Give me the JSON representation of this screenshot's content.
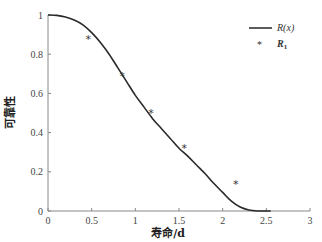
{
  "chart_data": {
    "type": "line",
    "title": "",
    "xlabel": "寿命/d",
    "ylabel": "可靠性",
    "xlim": [
      0,
      3
    ],
    "ylim": [
      0,
      1
    ],
    "x_ticks": [
      "0",
      "0.5",
      "1",
      "1.5",
      "2",
      "2.5",
      "3"
    ],
    "y_ticks": [
      "0",
      "0.2",
      "0.4",
      "0.6",
      "0.8",
      "1"
    ],
    "grid": false,
    "legend_position": "upper right",
    "series": [
      {
        "name": "R(x)",
        "style": "line",
        "x": [
          0,
          0.1,
          0.2,
          0.3,
          0.4,
          0.5,
          0.6,
          0.7,
          0.8,
          0.9,
          1.0,
          1.1,
          1.2,
          1.3,
          1.4,
          1.5,
          1.6,
          1.7,
          1.8,
          1.9,
          2.0,
          2.1,
          2.2,
          2.3,
          2.4,
          2.5,
          2.55
        ],
        "values": [
          1.0,
          0.998,
          0.99,
          0.975,
          0.95,
          0.91,
          0.86,
          0.8,
          0.73,
          0.66,
          0.59,
          0.53,
          0.47,
          0.42,
          0.37,
          0.32,
          0.28,
          0.235,
          0.19,
          0.14,
          0.095,
          0.05,
          0.02,
          0.005,
          0.0,
          0.0,
          0.0
        ]
      },
      {
        "name": "R1",
        "style": "scatter",
        "marker": "*",
        "x": [
          0.46,
          0.85,
          1.18,
          1.56,
          2.15
        ],
        "values": [
          0.88,
          0.69,
          0.5,
          0.32,
          0.14
        ]
      }
    ]
  },
  "labels": {
    "xlabel": "寿命/d",
    "ylabel": "可靠性",
    "legend_line": "R(x)",
    "legend_marker_main": "R",
    "legend_marker_sub": "1",
    "marker_glyph": "*"
  }
}
